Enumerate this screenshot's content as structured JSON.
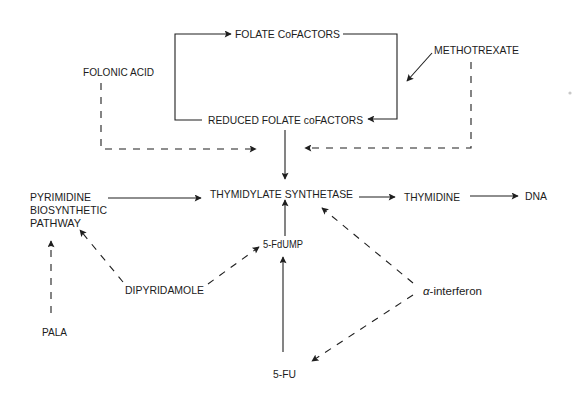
{
  "diagram": {
    "nodes": {
      "folate_cofactors": "FOLATE CoFACTORS",
      "reduced_folate_cofactors": "REDUCED FOLATE coFACTORS",
      "folonic_acid": "FOLONIC ACID",
      "methotrexate": "METHOTREXATE",
      "pyrimidine_line1": "PYRIMIDINE",
      "pyrimidine_line2": "BIOSYNTHETIC",
      "pyrimidine_line3": "PATHWAY",
      "thymidylate_synthetase": "THYMIDYLATE SYNTHETASE",
      "thymidine": "THYMIDINE",
      "dna": "DNA",
      "fdump": "5-FdUMP",
      "dipyridamole": "DIPYRIDAMOLE",
      "alpha_symbol": "α",
      "interferon": "-interferon",
      "pala": "PALA",
      "fu": "5-FU"
    },
    "edges": [
      {
        "from": "REDUCED FOLATE coFACTORS",
        "to": "FOLATE CoFACTORS",
        "style": "solid"
      },
      {
        "from": "FOLATE CoFACTORS",
        "to": "REDUCED FOLATE coFACTORS",
        "style": "solid"
      },
      {
        "from": "METHOTREXATE",
        "to": "FOLATE cycle",
        "style": "solid"
      },
      {
        "from": "FOLONIC ACID",
        "to": "THYMIDYLATE SYNTHETASE",
        "style": "dashed"
      },
      {
        "from": "METHOTREXATE",
        "to": "THYMIDYLATE SYNTHETASE",
        "style": "dashed"
      },
      {
        "from": "REDUCED FOLATE coFACTORS",
        "to": "THYMIDYLATE SYNTHETASE",
        "style": "solid"
      },
      {
        "from": "PYRIMIDINE BIOSYNTHETIC PATHWAY",
        "to": "THYMIDYLATE SYNTHETASE",
        "style": "solid"
      },
      {
        "from": "THYMIDYLATE SYNTHETASE",
        "to": "THYMIDINE",
        "style": "solid"
      },
      {
        "from": "THYMIDINE",
        "to": "DNA",
        "style": "solid"
      },
      {
        "from": "5-FdUMP",
        "to": "THYMIDYLATE SYNTHETASE",
        "style": "solid"
      },
      {
        "from": "5-FU",
        "to": "5-FdUMP",
        "style": "solid"
      },
      {
        "from": "DIPYRIDAMOLE",
        "to": "5-FdUMP",
        "style": "dashed"
      },
      {
        "from": "DIPYRIDAMOLE",
        "to": "PYRIMIDINE BIOSYNTHETIC PATHWAY",
        "style": "dashed"
      },
      {
        "from": "PALA",
        "to": "PYRIMIDINE BIOSYNTHETIC PATHWAY",
        "style": "dashed"
      },
      {
        "from": "α-interferon",
        "to": "THYMIDYLATE SYNTHETASE",
        "style": "dashed"
      },
      {
        "from": "α-interferon",
        "to": "5-FU",
        "style": "dashed"
      }
    ],
    "colors": {
      "ink": "#1f1f1f",
      "background": "#ffffff"
    }
  }
}
